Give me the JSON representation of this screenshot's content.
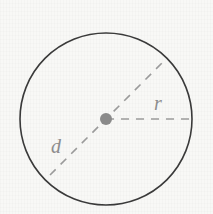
{
  "figure": {
    "background_color": "#f8f8f6",
    "circle_stroke_color": "#3a3a3a",
    "dash_color": "#9a9a9a",
    "center_dot_color": "#8a8a8a",
    "label_color": "#8d8d8d"
  },
  "labels": {
    "radius": "r",
    "diameter": "d"
  },
  "geometry": {
    "center_x": 106,
    "center_y": 119,
    "radius": 86,
    "center_dot_radius": 6,
    "circle_stroke_width": 1.6,
    "dash_stroke_width": 1.6,
    "dash_pattern": "8 7",
    "radius_line": {
      "x1": 106,
      "y1": 119,
      "x2": 192,
      "y2": 119
    },
    "diameter_line": {
      "x1": 50,
      "y1": 175,
      "x2": 163,
      "y2": 62,
      "angle_degrees": 45
    },
    "radius_label_position": {
      "x": 158,
      "y": 119
    },
    "diameter_label_position": {
      "x": 56,
      "y": 156
    }
  },
  "chart_data": {
    "type": "diagram",
    "shape": "circle",
    "elements": [
      {
        "name": "circle-outline",
        "kind": "circle",
        "cx": 106,
        "cy": 119,
        "r": 86,
        "style": "solid"
      },
      {
        "name": "center-point",
        "kind": "point",
        "x": 106,
        "y": 119
      },
      {
        "name": "radius-segment",
        "kind": "segment",
        "label": "r",
        "from": [
          106,
          119
        ],
        "to": [
          192,
          119
        ],
        "style": "dashed",
        "length_px": 86
      },
      {
        "name": "diameter-segment",
        "kind": "segment",
        "label": "d",
        "from": [
          50,
          175
        ],
        "to": [
          163,
          62
        ],
        "style": "dashed",
        "length_px": 172
      }
    ],
    "annotations": [
      "r",
      "d"
    ]
  }
}
